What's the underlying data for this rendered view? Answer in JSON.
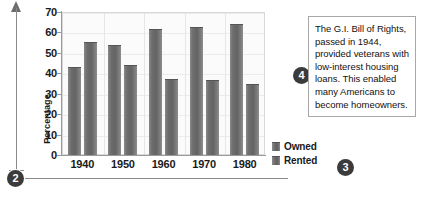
{
  "chart_data": {
    "type": "bar",
    "title": "",
    "xlabel": "",
    "ylabel": "Percentage",
    "ylim": [
      0,
      70
    ],
    "ytick_step": 10,
    "grid": true,
    "legend_position": "right-bottom",
    "categories": [
      "1940",
      "1950",
      "1960",
      "1970",
      "1980"
    ],
    "yticks": [
      "70",
      "60",
      "50",
      "40",
      "30",
      "20",
      "10",
      "0"
    ],
    "series": [
      {
        "name": "Owned",
        "values": [
          43,
          54,
          61.5,
          62.5,
          64
        ]
      },
      {
        "name": "Rented",
        "values": [
          55.5,
          44,
          37,
          36.5,
          35
        ]
      }
    ]
  },
  "legend": {
    "items": [
      {
        "label": "Owned"
      },
      {
        "label": "Rented"
      }
    ]
  },
  "callout": {
    "text": "The G.I. Bill of Rights, passed in 1944, provided veterans with low-interest housing loans. This enabled many Americans to become homeowners."
  },
  "markers": {
    "axis_marker": "2",
    "legend_marker": "3",
    "callout_marker": "4"
  }
}
